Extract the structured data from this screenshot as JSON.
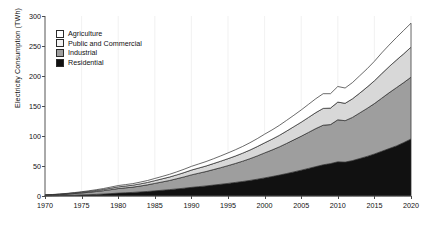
{
  "chart_data": {
    "type": "area",
    "stacked": true,
    "title": "",
    "xlabel": "",
    "ylabel": "Electricity Consumption (TWh)",
    "xlim": [
      1970,
      2020
    ],
    "ylim": [
      0,
      300
    ],
    "yticks": [
      0,
      50,
      100,
      150,
      200,
      250,
      300
    ],
    "xticks": [
      1970,
      1975,
      1980,
      1985,
      1990,
      1995,
      2000,
      2005,
      2010,
      2015,
      2020
    ],
    "grid": "vertical-only-faint",
    "legend_position": "upper-left-inside",
    "x": [
      1970,
      1971,
      1972,
      1973,
      1974,
      1975,
      1976,
      1977,
      1978,
      1979,
      1980,
      1981,
      1982,
      1983,
      1984,
      1985,
      1986,
      1987,
      1988,
      1989,
      1990,
      1991,
      1992,
      1993,
      1994,
      1995,
      1996,
      1997,
      1998,
      1999,
      2000,
      2001,
      2002,
      2003,
      2004,
      2005,
      2006,
      2007,
      2008,
      2009,
      2010,
      2011,
      2012,
      2013,
      2014,
      2015,
      2016,
      2017,
      2018,
      2019,
      2020
    ],
    "series": [
      {
        "name": "Residential",
        "color": "#111111",
        "stack_order": 1,
        "values": [
          0.4,
          0.6,
          0.8,
          1.1,
          1.4,
          1.8,
          2.2,
          2.7,
          3.3,
          4.0,
          4.8,
          5.4,
          6.0,
          6.8,
          7.6,
          8.6,
          9.6,
          10.6,
          11.8,
          13.0,
          14.4,
          15.6,
          16.8,
          18.2,
          19.6,
          21.0,
          22.6,
          24.2,
          26.0,
          28.0,
          30.2,
          32.4,
          34.8,
          37.4,
          40.2,
          43.0,
          46.0,
          49.0,
          52.0,
          54.0,
          57.0,
          56.5,
          59.0,
          62.5,
          66.0,
          70.0,
          74.5,
          79.0,
          83.5,
          89.0,
          95.0
        ]
      },
      {
        "name": "Industrial",
        "color": "#9e9e9e",
        "stack_order": 2,
        "values": [
          0.9,
          1.2,
          1.6,
          2.1,
          2.7,
          3.3,
          4.0,
          4.8,
          5.6,
          6.6,
          7.6,
          8.2,
          8.8,
          9.8,
          11.0,
          12.4,
          13.8,
          15.2,
          17.0,
          18.8,
          20.8,
          22.4,
          24.0,
          25.8,
          27.6,
          29.6,
          31.6,
          33.8,
          36.2,
          38.8,
          41.6,
          44.2,
          47.0,
          50.2,
          53.4,
          56.6,
          60.0,
          63.4,
          66.0,
          65.0,
          70.0,
          69.0,
          72.0,
          76.0,
          80.0,
          84.0,
          88.5,
          93.0,
          97.0,
          100.0,
          103.0
        ]
      },
      {
        "name": "Public and Commercial",
        "color": "#d8d8d8",
        "stack_order": 3,
        "values": [
          0.3,
          0.4,
          0.5,
          0.7,
          0.9,
          1.1,
          1.4,
          1.7,
          2.0,
          2.4,
          2.8,
          3.0,
          3.2,
          3.6,
          4.0,
          4.6,
          5.2,
          5.8,
          6.4,
          7.2,
          8.0,
          8.6,
          9.2,
          10.0,
          10.8,
          11.6,
          12.4,
          13.4,
          14.4,
          15.6,
          16.8,
          18.0,
          19.2,
          20.6,
          22.0,
          23.4,
          25.0,
          26.6,
          28.0,
          27.5,
          29.5,
          29.0,
          31.0,
          33.0,
          35.5,
          38.0,
          41.0,
          43.5,
          46.0,
          48.0,
          50.0
        ]
      },
      {
        "name": "Agriculture",
        "color": "#ffffff",
        "stack_order": 4,
        "values": [
          0.2,
          0.3,
          0.4,
          0.5,
          0.7,
          0.9,
          1.1,
          1.3,
          1.6,
          1.9,
          2.2,
          2.4,
          2.6,
          2.9,
          3.2,
          3.6,
          4.0,
          4.5,
          5.0,
          5.6,
          6.2,
          6.8,
          7.4,
          8.0,
          8.8,
          9.6,
          10.4,
          11.2,
          12.2,
          13.2,
          14.4,
          15.4,
          16.6,
          17.8,
          19.0,
          20.4,
          21.8,
          23.2,
          24.5,
          24.0,
          26.0,
          25.5,
          27.0,
          29.0,
          30.5,
          32.5,
          34.5,
          36.0,
          37.5,
          39.0,
          40.0
        ]
      }
    ],
    "legend_order": [
      "Agriculture",
      "Public and Commercial",
      "Industrial",
      "Residential"
    ]
  },
  "axes": {
    "y_label": "Electricity Consumption (TWh)",
    "y_tick_labels": [
      "0",
      "50",
      "100",
      "150",
      "200",
      "250",
      "300"
    ],
    "x_tick_labels": [
      "1970",
      "1975",
      "1980",
      "1985",
      "1990",
      "1995",
      "2000",
      "2005",
      "2010",
      "2015",
      "2020"
    ]
  },
  "legend": {
    "items": [
      {
        "label": "Agriculture",
        "color": "#ffffff"
      },
      {
        "label": "Public and Commercial",
        "color": "#f2f2f2"
      },
      {
        "label": "Industrial",
        "color": "#9e9e9e"
      },
      {
        "label": "Residential",
        "color": "#111111"
      }
    ]
  },
  "style": {
    "axis_color": "#4a4a4a",
    "grid_color": "#ededed",
    "outline_color": "#2b2b2b",
    "background": "#ffffff"
  }
}
